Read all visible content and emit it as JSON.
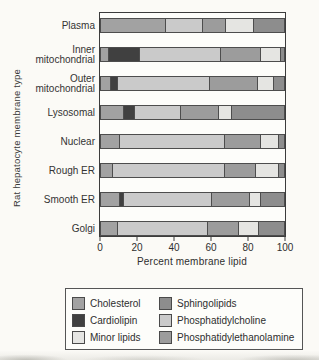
{
  "chart_data": {
    "type": "bar",
    "variant": "horizontal-stacked",
    "title": "",
    "xlabel": "Percent membrane lipid",
    "ylabel": "Rat hepatocyte membrane type",
    "xlim": [
      0,
      100
    ],
    "x_ticks": [
      0,
      20,
      40,
      60,
      80,
      100
    ],
    "grid": false,
    "legend_position": "bottom-box",
    "categories": [
      "Plasma",
      "Inner mitochondrial",
      "Outer mitochondrial",
      "Lysosomal",
      "Nuclear",
      "Rough ER",
      "Smooth ER",
      "Golgi"
    ],
    "category_lines": [
      [
        "Plasma"
      ],
      [
        "Inner",
        "mitochondrial"
      ],
      [
        "Outer",
        "mitochondrial"
      ],
      [
        "Lysosomal"
      ],
      [
        "Nuclear"
      ],
      [
        "Rough ER"
      ],
      [
        "Smooth ER"
      ],
      [
        "Golgi"
      ]
    ],
    "series": [
      {
        "name": "Cholesterol",
        "color": "#a2a2a2",
        "values": [
          35,
          4,
          5,
          12,
          10,
          6,
          10,
          9
        ]
      },
      {
        "name": "Cardiolipin",
        "color": "#404040",
        "values": [
          0,
          17,
          4,
          6,
          0,
          0,
          2,
          0
        ]
      },
      {
        "name": "Phosphatidylcholine",
        "color": "#cacaca",
        "values": [
          20,
          44,
          50,
          25,
          57,
          61,
          48,
          49
        ]
      },
      {
        "name": "Phosphatidylethanolamine",
        "color": "#9c9c9c",
        "values": [
          13,
          22,
          26,
          21,
          20,
          17,
          21,
          17
        ]
      },
      {
        "name": "Minor lipids",
        "color": "#e5e5e2",
        "values": [
          15,
          11,
          9,
          7,
          10,
          13,
          6,
          11
        ]
      },
      {
        "name": "Sphingolipids",
        "color": "#8d8d8d",
        "values": [
          17,
          2,
          6,
          29,
          3,
          3,
          13,
          14
        ]
      }
    ]
  },
  "legend": {
    "items": [
      {
        "label": "Cholesterol",
        "color": "#a2a2a2"
      },
      {
        "label": "Cardiolipin",
        "color": "#404040"
      },
      {
        "label": "Minor lipids",
        "color": "#e5e5e2"
      },
      {
        "label": "Sphingolipids",
        "color": "#8d8d8d"
      },
      {
        "label": "Phosphatidylcholine",
        "color": "#cacaca"
      },
      {
        "label": "Phosphatidylethanolamine",
        "color": "#9c9c9c"
      }
    ]
  }
}
